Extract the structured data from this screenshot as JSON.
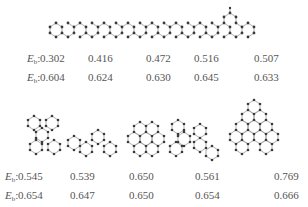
{
  "figure": {
    "label_prefix": "E",
    "label_sub": "b",
    "label_suffix": ":",
    "colors": {
      "atom": "#3a3a3a",
      "bond": "#8a8a8a",
      "hydrogen": "#b0b0b0",
      "text": "#555555"
    },
    "top_row": {
      "structures": [
        "linear chain of fused hexagonal rings with branch on right end"
      ],
      "row1": [
        "0.302",
        "0.416",
        "0.472",
        "0.516",
        "0.507"
      ],
      "row2": [
        "0.604",
        "0.624",
        "0.630",
        "0.645",
        "0.633"
      ]
    },
    "bottom_row": {
      "structures": [
        "branched ring cluster",
        "zigzag ring chain",
        "compact fused ring flake",
        "branched ring chain",
        "large triangular ring flake"
      ],
      "row1": [
        "0.545",
        "0.539",
        "0.650",
        "0.561",
        "0.769"
      ],
      "row2": [
        "0.654",
        "0.647",
        "0.650",
        "0.654",
        "0.666"
      ]
    }
  }
}
